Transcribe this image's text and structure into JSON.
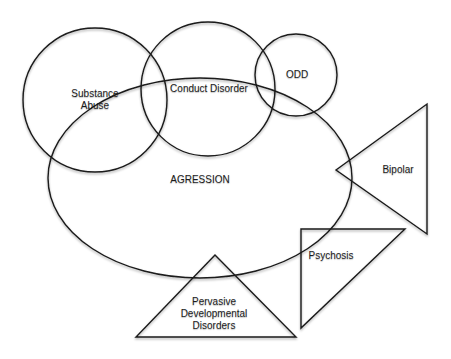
{
  "diagram": {
    "type": "venn-overlap",
    "central": {
      "label": "AGRESSION",
      "shape": "ellipse",
      "cx": 200,
      "cy": 178,
      "rx": 152,
      "ry": 100
    },
    "circles": [
      {
        "id": "substance-abuse",
        "label": "Substance\nAbuse",
        "cx": 95,
        "cy": 100,
        "r": 72,
        "label_x": 95,
        "label_y": 100
      },
      {
        "id": "conduct-disorder",
        "label": "Conduct Disorder",
        "cx": 208,
        "cy": 89,
        "r": 67,
        "label_x": 209,
        "label_y": 89
      },
      {
        "id": "odd",
        "label": "ODD",
        "cx": 296,
        "cy": 75,
        "r": 41,
        "label_x": 297,
        "label_y": 75
      }
    ],
    "triangles": [
      {
        "id": "bipolar",
        "label": "Bipolar",
        "points": "336,170 427,104 427,234",
        "label_x": 398,
        "label_y": 170
      },
      {
        "id": "psychosis",
        "label": "Psychosis",
        "points": "301,229 405,229 301,328",
        "label_x": 331,
        "label_y": 256
      },
      {
        "id": "pervasive-developmental-disorders",
        "label": "Pervasive\nDevelopmental\nDisorders",
        "points": "136,337 296,337 215,255",
        "label_x": 214,
        "label_y": 314
      }
    ],
    "central_label_x": 200,
    "central_label_y": 180
  }
}
